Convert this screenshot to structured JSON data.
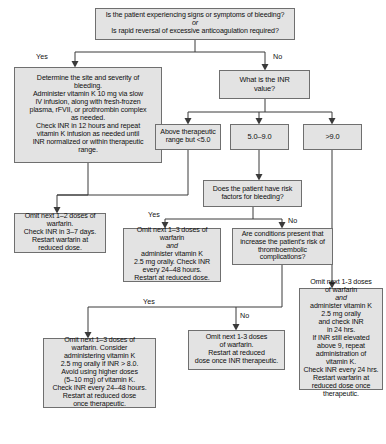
{
  "style": {
    "node_fill": "#e3e3e3",
    "node_border": "#6f6f6f",
    "edge_color": "#3a3a3a",
    "background": "#ffffff"
  },
  "nodes": {
    "root": {
      "id": "root",
      "type": "decision",
      "lines": [
        "Is the patient experiencing signs or symptoms of bleeding?",
        "or",
        "Is rapid reversal of excessive anticoagulation required?"
      ]
    },
    "bleeding_mgmt": {
      "id": "bleeding-management",
      "type": "action",
      "lines": [
        "Determine the site and severity of",
        "bleeding.",
        "Administer vitamin K 10 mg via slow",
        "IV infusion, along with fresh-frozen",
        "plasma, rFVII, or prothrombin complex",
        "as needed.",
        "Check INR in 12 hours and repeat",
        "vitamin K infusion as needed until",
        "INR normalized or within therapeutic",
        "range."
      ]
    },
    "inr_value": {
      "id": "inr-value",
      "type": "decision",
      "lines": [
        "What is the INR",
        "value?"
      ]
    },
    "above_therapeutic": {
      "id": "above-therapeutic-range",
      "type": "branch",
      "lines": [
        "Above therapeutic",
        "range but <5.0"
      ]
    },
    "inr_5_9": {
      "id": "inr-5-to-9",
      "type": "branch",
      "lines": [
        "5.0–9.0"
      ]
    },
    "inr_gt9": {
      "id": "inr-greater-than-9",
      "type": "branch",
      "lines": [
        ">9.0"
      ]
    },
    "risk_factors": {
      "id": "risk-factors-for-bleeding",
      "type": "decision",
      "lines": [
        "Does the patient have risk",
        "factors for bleeding?"
      ]
    },
    "omit_1_2": {
      "id": "omit-1-2-doses",
      "type": "action",
      "lines": [
        "Omit next 1–2 doses of",
        "warfarin.",
        "Check INR in 3–7 days.",
        "Restart warfarin at",
        "reduced dose."
      ]
    },
    "omit_1_3_vitk": {
      "id": "omit-1-3-doses-vitamin-k",
      "type": "action",
      "lines": [
        "Omit next 1–3 doses of",
        "warfarin",
        "and",
        "administer vitamin K",
        "2.5 mg orally. Check INR",
        "every 24–48 hours.",
        "Restart at reduced dose."
      ],
      "italic_line_index": 2
    },
    "thromboembolic": {
      "id": "thromboembolic-risk",
      "type": "decision",
      "lines": [
        "Are conditions present that",
        "increase the patient's risk of",
        "thromboembolic",
        "complications?"
      ]
    },
    "omit_1_3_consider": {
      "id": "omit-1-3-doses-consider-vitamin-k",
      "type": "action",
      "lines": [
        "Omit next 1–3 doses of",
        "warfarin. Consider",
        "administering vitamin K",
        "2.5 mg orally if INR > 8.0.",
        "Avoid using higher doses",
        "(5–10 mg) of vitamin K.",
        "Check INR every 24–48 hours.",
        "Restart at reduced dose",
        "once therapeutic."
      ]
    },
    "omit_1_3_simple": {
      "id": "omit-1-3-doses-restart",
      "type": "action",
      "lines": [
        "Omit next 1-3 doses",
        "of warfarin.",
        "Restart at reduced",
        "dose once INR therapeutic."
      ]
    },
    "omit_1_3_high": {
      "id": "omit-1-3-doses-high-inr",
      "type": "action",
      "lines": [
        "Omit next 1-3 doses",
        "of warfarin",
        "and",
        "administer vitamin K",
        "2.5 mg orally",
        "and check INR",
        "in 24 hrs.",
        "If INR still elevated",
        "above 9, repeat",
        "administration of",
        "vitamin K.",
        "Check INR every 24 hrs.",
        "Restart warfarin at",
        "reduced dose once",
        "therapeutic."
      ],
      "italic_line_index": 2
    }
  },
  "edge_labels": {
    "root_yes": "Yes",
    "root_no": "No",
    "risk_yes": "Yes",
    "risk_no": "No",
    "thromb_yes": "Yes",
    "thromb_no": "No"
  }
}
